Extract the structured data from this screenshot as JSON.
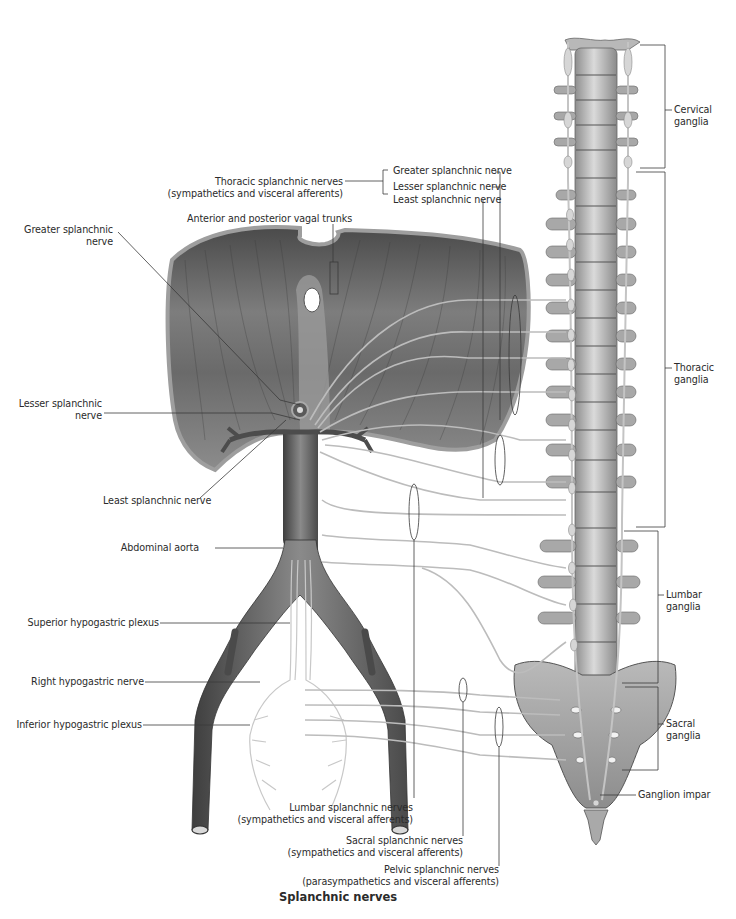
{
  "figure": {
    "title": "Splanchnic nerves",
    "colors": {
      "muscle_dark": "#5c5c5c",
      "muscle_mid": "#8a8a8a",
      "bone_light": "#d4d4d4",
      "bone_mid": "#b0b0b0",
      "bone_dark": "#7a7a7a",
      "nerve": "#bdbdbd",
      "leader": "#3a3a3a",
      "background": "#ffffff"
    }
  },
  "labels": {
    "thoracic_splanchnic": {
      "line1": "Thoracic splanchnic nerves",
      "line2": "(sympathetics and visceral afferents)"
    },
    "greater_splanchnic_nerve_top": "Greater splanchnic nerve",
    "lesser_splanchnic_nerve_top": "Lesser splanchnic nerve",
    "least_splanchnic_nerve_top": "Least splanchnic nerve",
    "vagal_trunks": "Anterior and posterior vagal trunks",
    "greater_splanchnic_left": {
      "line1": "Greater splanchnic",
      "line2": "nerve"
    },
    "lesser_splanchnic_left": {
      "line1": "Lesser splanchnic",
      "line2": "nerve"
    },
    "least_splanchnic_left": "Least splanchnic nerve",
    "abdominal_aorta": "Abdominal aorta",
    "superior_hypogastric": "Superior hypogastric plexus",
    "right_hypogastric": "Right hypogastric nerve",
    "inferior_hypogastric": "Inferior hypogastric plexus",
    "lumbar_splanchnic": {
      "line1": "Lumbar splanchnic nerves",
      "line2": "(sympathetics and visceral afferents)"
    },
    "sacral_splanchnic": {
      "line1": "Sacral splanchnic nerves",
      "line2": "(sympathetics and visceral afferents)"
    },
    "pelvic_splanchnic": {
      "line1": "Pelvic splanchnic nerves",
      "line2": "(parasympathetics and visceral afferents)"
    },
    "cervical_ganglia": {
      "line1": "Cervical",
      "line2": "ganglia"
    },
    "thoracic_ganglia": {
      "line1": "Thoracic",
      "line2": "ganglia"
    },
    "lumbar_ganglia": {
      "line1": "Lumbar",
      "line2": "ganglia"
    },
    "sacral_ganglia": {
      "line1": "Sacral",
      "line2": "ganglia"
    },
    "ganglion_impar": "Ganglion impar"
  }
}
